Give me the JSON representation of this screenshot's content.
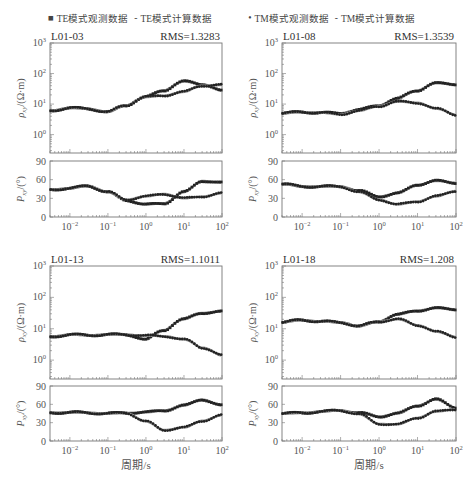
{
  "legend": {
    "items": [
      {
        "marker": "■",
        "label": "TE模式观测数据"
      },
      {
        "marker": "-",
        "label": "TE模式计算数据"
      },
      {
        "marker": "•",
        "label": "TM模式观测数据"
      },
      {
        "marker": "-",
        "label": "TM模式计算数据"
      }
    ]
  },
  "colors": {
    "observed": "#222222",
    "calculated": "#999999",
    "frame": "#777777"
  },
  "chart_data": [
    {
      "type": "scatter",
      "station": "L01-03",
      "rms_label": "RMS=1.3283",
      "xlabel": "",
      "x_scale": "log",
      "xlim": [
        0.003,
        100
      ],
      "x_ticks": [
        "10^-2",
        "10^-1",
        "10^0",
        "10^1",
        "10^2"
      ],
      "rho": {
        "ylabel": "ρxy/(Ω·m)",
        "y_scale": "log",
        "ylim": [
          0.25,
          1000
        ],
        "y_ticks": [
          "10^0",
          "10^1",
          "10^2",
          "10^3"
        ],
        "series": [
          {
            "name": "TE observed/calculated",
            "x": [
              0.003,
              0.01,
              0.03,
              0.1,
              0.3,
              1,
              3,
              10,
              30,
              100
            ],
            "values": [
              6,
              7.5,
              7,
              5.5,
              9,
              17,
              28,
              55,
              45,
              27
            ]
          },
          {
            "name": "TM observed/calculated",
            "x": [
              0.003,
              0.01,
              0.03,
              0.1,
              0.3,
              1,
              3,
              10,
              30,
              100
            ],
            "values": [
              6,
              7.5,
              7,
              5.5,
              9,
              17,
              19,
              25,
              40,
              42
            ]
          }
        ]
      },
      "phase": {
        "ylabel": "Pxy/(°)",
        "ylim": [
          0,
          90
        ],
        "y_ticks": [
          0,
          30,
          60,
          90
        ],
        "series": [
          {
            "name": "TE",
            "x": [
              0.003,
              0.01,
              0.03,
              0.1,
              0.3,
              1,
              3,
              10,
              30,
              100
            ],
            "values": [
              44,
              46,
              50,
              40,
              27,
              20,
              22,
              40,
              58,
              55
            ]
          },
          {
            "name": "TM",
            "x": [
              0.003,
              0.01,
              0.03,
              0.1,
              0.3,
              1,
              3,
              10,
              30,
              100
            ],
            "values": [
              44,
              46,
              50,
              40,
              28,
              33,
              37,
              30,
              33,
              38
            ]
          }
        ]
      }
    },
    {
      "type": "scatter",
      "station": "L01-08",
      "rms_label": "RMS=1.3539",
      "xlabel": "",
      "x_scale": "log",
      "xlim": [
        0.003,
        100
      ],
      "x_ticks": [
        "10^-2",
        "10^-1",
        "10^0",
        "10^1",
        "10^2"
      ],
      "rho": {
        "ylabel": "ρxy/(Ω·m)",
        "y_scale": "log",
        "ylim": [
          0.25,
          1000
        ],
        "y_ticks": [
          "10^0",
          "10^1",
          "10^2",
          "10^3"
        ],
        "series": [
          {
            "name": "TE observed/calculated",
            "x": [
              0.003,
              0.01,
              0.03,
              0.1,
              0.3,
              1,
              3,
              10,
              30,
              100
            ],
            "values": [
              5,
              5.5,
              5.2,
              5,
              6.5,
              9,
              15,
              28,
              48,
              45
            ]
          },
          {
            "name": "TM observed/calculated",
            "x": [
              0.003,
              0.01,
              0.03,
              0.1,
              0.3,
              1,
              3,
              10,
              30,
              100
            ],
            "values": [
              5,
              5.5,
              5.2,
              4.6,
              6,
              8.5,
              12,
              11,
              7,
              4.5
            ]
          }
        ]
      },
      "phase": {
        "ylabel": "Pxy/(°)",
        "ylim": [
          0,
          90
        ],
        "y_ticks": [
          0,
          30,
          60,
          90
        ],
        "series": [
          {
            "name": "TE",
            "x": [
              0.003,
              0.01,
              0.03,
              0.1,
              0.3,
              1,
              3,
              10,
              30,
              100
            ],
            "values": [
              53,
              49,
              49,
              49,
              42,
              33,
              38,
              52,
              58,
              55
            ]
          },
          {
            "name": "TM",
            "x": [
              0.003,
              0.01,
              0.03,
              0.1,
              0.3,
              1,
              3,
              10,
              30,
              100
            ],
            "values": [
              53,
              49,
              49,
              49,
              40,
              28,
              20,
              25,
              33,
              42
            ]
          }
        ]
      }
    },
    {
      "type": "scatter",
      "station": "L01-13",
      "rms_label": "RMS=1.1011",
      "xlabel": "周期/s",
      "x_scale": "log",
      "xlim": [
        0.003,
        100
      ],
      "x_ticks": [
        "10^-2",
        "10^-1",
        "10^0",
        "10^1",
        "10^2"
      ],
      "rho": {
        "ylabel": "ρxy/(Ω·m)",
        "y_scale": "log",
        "ylim": [
          0.25,
          1000
        ],
        "y_ticks": [
          "10^0",
          "10^1",
          "10^2",
          "10^3"
        ],
        "series": [
          {
            "name": "TE observed/calculated",
            "x": [
              0.003,
              0.01,
              0.03,
              0.1,
              0.3,
              1,
              3,
              10,
              30,
              100
            ],
            "values": [
              5.5,
              6.5,
              6.2,
              6.5,
              6.5,
              4.5,
              9,
              20,
              32,
              35
            ]
          },
          {
            "name": "TM observed/calculated",
            "x": [
              0.003,
              0.01,
              0.03,
              0.1,
              0.3,
              1,
              3,
              10,
              30,
              100
            ],
            "values": [
              5.5,
              6.5,
              6.2,
              6.5,
              6.5,
              6,
              5.8,
              4.5,
              2.5,
              1.4
            ]
          }
        ]
      },
      "phase": {
        "ylabel": "Pxy/(°)",
        "ylim": [
          0,
          90
        ],
        "y_ticks": [
          0,
          30,
          60,
          90
        ],
        "series": [
          {
            "name": "TE",
            "x": [
              0.003,
              0.01,
              0.03,
              0.1,
              0.3,
              1,
              3,
              10,
              30,
              100
            ],
            "values": [
              46,
              47,
              46,
              45,
              46,
              47,
              50,
              58,
              68,
              58
            ]
          },
          {
            "name": "TM",
            "x": [
              0.003,
              0.01,
              0.03,
              0.1,
              0.3,
              1,
              3,
              10,
              30,
              100
            ],
            "values": [
              46,
              47,
              46,
              45,
              46,
              32,
              18,
              22,
              33,
              42
            ]
          }
        ]
      }
    },
    {
      "type": "scatter",
      "station": "L01-18",
      "rms_label": "RMS=1.208",
      "xlabel": "周期/s",
      "x_scale": "log",
      "xlim": [
        0.003,
        100
      ],
      "x_ticks": [
        "10^-2",
        "10^-1",
        "10^0",
        "10^1",
        "10^2"
      ],
      "rho": {
        "ylabel": "ρxy/(Ω·m)",
        "y_scale": "log",
        "ylim": [
          0.25,
          1000
        ],
        "y_ticks": [
          "10^0",
          "10^1",
          "10^2",
          "10^3"
        ],
        "series": [
          {
            "name": "TE observed/calculated",
            "x": [
              0.003,
              0.01,
              0.03,
              0.1,
              0.3,
              1,
              3,
              10,
              30,
              100
            ],
            "values": [
              16,
              19,
              17,
              16,
              12,
              17,
              28,
              38,
              45,
              42
            ]
          },
          {
            "name": "TM observed/calculated",
            "x": [
              0.003,
              0.01,
              0.03,
              0.1,
              0.3,
              1,
              3,
              10,
              30,
              100
            ],
            "values": [
              16,
              19,
              17,
              16,
              12,
              17,
              20,
              13,
              8,
              5.5
            ]
          }
        ]
      },
      "phase": {
        "ylabel": "Pxy/(°)",
        "ylim": [
          0,
          90
        ],
        "y_ticks": [
          0,
          30,
          60,
          90
        ],
        "series": [
          {
            "name": "TE",
            "x": [
              0.003,
              0.01,
              0.03,
              0.1,
              0.3,
              1,
              3,
              10,
              30,
              100
            ],
            "values": [
              45,
              46,
              48,
              50,
              46,
              40,
              45,
              58,
              68,
              55
            ]
          },
          {
            "name": "TM",
            "x": [
              0.003,
              0.01,
              0.03,
              0.1,
              0.3,
              1,
              3,
              10,
              30,
              100
            ],
            "values": [
              45,
              46,
              48,
              50,
              44,
              28,
              27,
              38,
              48,
              52
            ]
          }
        ]
      }
    }
  ]
}
